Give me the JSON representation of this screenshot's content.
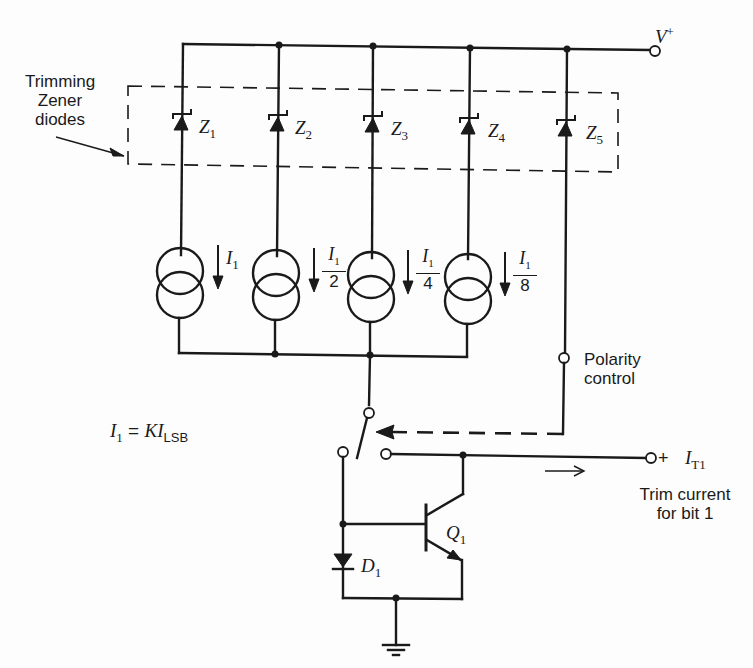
{
  "diagram": {
    "type": "circuit-schematic",
    "supply": {
      "label": "V",
      "superscript": "+"
    },
    "zener_group_label": {
      "line1": "Trimming",
      "line2": "Zener",
      "line3": "diodes"
    },
    "zeners": [
      {
        "id": "Z1",
        "name": "Z",
        "sub": "1"
      },
      {
        "id": "Z2",
        "name": "Z",
        "sub": "2"
      },
      {
        "id": "Z3",
        "name": "Z",
        "sub": "3"
      },
      {
        "id": "Z4",
        "name": "Z",
        "sub": "4"
      },
      {
        "id": "Z5",
        "name": "Z",
        "sub": "5"
      }
    ],
    "current_sources": [
      {
        "name": "I",
        "sub": "1",
        "denominator": ""
      },
      {
        "name": "I",
        "sub": "1",
        "denominator": "2"
      },
      {
        "name": "I",
        "sub": "1",
        "denominator": "4"
      },
      {
        "name": "I",
        "sub": "1",
        "denominator": "8"
      }
    ],
    "equation": {
      "lhs": "I",
      "lhs_sub": "1",
      "eq": " = ",
      "rhs": "KI",
      "rhs_sub": "LSB"
    },
    "polarity_label": {
      "line1": "Polarity",
      "line2": "control"
    },
    "output": {
      "plus": "+",
      "name": "I",
      "sub": "T1"
    },
    "output_caption": {
      "line1": "Trim current",
      "line2": "for bit 1"
    },
    "transistor": {
      "name": "Q",
      "sub": "1"
    },
    "diode": {
      "name": "D",
      "sub": "1"
    },
    "colors": {
      "ink": "#1a1a1a",
      "paper": "#fdfdfd"
    }
  }
}
